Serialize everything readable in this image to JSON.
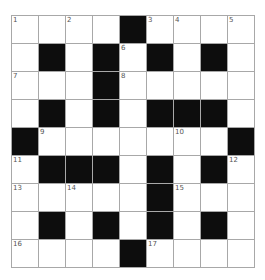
{
  "title": "",
  "colors": {
    "black_cell": "#0d0d0d",
    "white_cell": "#ffffff",
    "grid_line": "#a8a8a8",
    "number": "#555555"
  },
  "grid": {
    "rows": 9,
    "cols": 9,
    "layout": [
      "WWWWBWWWW",
      "WBWBWBWBW",
      "WWWBWWWWW",
      "WBWBWBBBW",
      "BWWWWWWWB",
      "WBBBWBWBW",
      "WWWWWBWWW",
      "WBWBWBWBW",
      "WWWWBWWWW"
    ],
    "numbers": [
      {
        "row": 0,
        "col": 0,
        "n": "1"
      },
      {
        "row": 0,
        "col": 2,
        "n": "2"
      },
      {
        "row": 0,
        "col": 5,
        "n": "3"
      },
      {
        "row": 0,
        "col": 6,
        "n": "4"
      },
      {
        "row": 0,
        "col": 8,
        "n": "5"
      },
      {
        "row": 1,
        "col": 4,
        "n": "6"
      },
      {
        "row": 2,
        "col": 0,
        "n": "7"
      },
      {
        "row": 2,
        "col": 4,
        "n": "8"
      },
      {
        "row": 4,
        "col": 1,
        "n": "9"
      },
      {
        "row": 4,
        "col": 6,
        "n": "10"
      },
      {
        "row": 5,
        "col": 0,
        "n": "11"
      },
      {
        "row": 5,
        "col": 8,
        "n": "12"
      },
      {
        "row": 6,
        "col": 0,
        "n": "13"
      },
      {
        "row": 6,
        "col": 2,
        "n": "14"
      },
      {
        "row": 6,
        "col": 6,
        "n": "15"
      },
      {
        "row": 8,
        "col": 0,
        "n": "16"
      },
      {
        "row": 8,
        "col": 5,
        "n": "17"
      }
    ]
  }
}
